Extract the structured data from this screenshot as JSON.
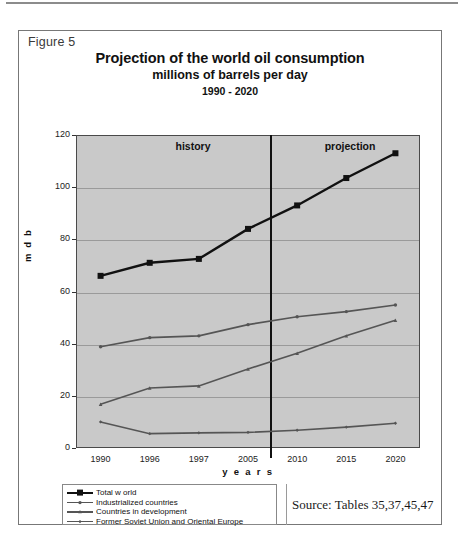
{
  "figure": {
    "label": "Figure 5",
    "title_main": "Projection of the world oil consumption",
    "title_sub": "millions of barrels per day",
    "title_range": "1990 - 2020",
    "source": "Source: Tables 35,37,45,47"
  },
  "annotations": {
    "history_label": "history",
    "projection_label": "projection"
  },
  "axis": {
    "ylabel": "m d b",
    "xlabel": "y e a r s",
    "yticks": [
      "0",
      "20",
      "40",
      "60",
      "80",
      "100",
      "120"
    ],
    "xticks": [
      "1990",
      "1996",
      "1997",
      "2005",
      "2010",
      "2015",
      "2020"
    ]
  },
  "colors": {
    "plot_background": "#c9c9c9",
    "gridline": "#9a9a9a",
    "axis": "#4a4a4a",
    "series_total_world": "#111111",
    "series_industrialized": "#555555",
    "series_development": "#555555",
    "series_fsu": "#555555",
    "divider": "#111111"
  },
  "chart_data": {
    "type": "line",
    "title": "Projection of the world oil consumption",
    "subtitle": "millions of barrels per day",
    "xlabel": "years",
    "ylabel": "m d b",
    "ylim": [
      0,
      120
    ],
    "ytick_step": 20,
    "grid": true,
    "legend_position": "below-left",
    "categories": [
      "1990",
      "1996",
      "1997",
      "2005",
      "2010",
      "2015",
      "2020"
    ],
    "annotations": [
      {
        "text": "history",
        "region": "left-of-divider"
      },
      {
        "text": "projection",
        "region": "right-of-divider"
      },
      {
        "text": "vertical divider between history and projection",
        "between": [
          "2005",
          "2010"
        ]
      }
    ],
    "series": [
      {
        "name": "Total world",
        "marker": "square",
        "values": [
          66,
          71,
          72.5,
          84,
          93,
          103.5,
          113
        ]
      },
      {
        "name": "Industrialized countries",
        "marker": "circle",
        "values": [
          38.8,
          42.3,
          43,
          47.3,
          50.3,
          52.3,
          54.8
        ]
      },
      {
        "name": "Countries in development",
        "marker": "triangle",
        "values": [
          16.8,
          23,
          23.8,
          30.3,
          36.3,
          43,
          49
        ]
      },
      {
        "name": "Former Soviet Union and Oriental Europe",
        "marker": "diamond",
        "values": [
          10,
          5.5,
          5.8,
          6,
          6.8,
          8,
          9.5
        ]
      }
    ]
  },
  "legend": {
    "items": [
      {
        "label": "Total w orld",
        "marker": "square"
      },
      {
        "label": "Industrialized countries",
        "marker": "circle"
      },
      {
        "label": "Countries in development",
        "marker": "triangle"
      },
      {
        "label": "Former Soviet Union and Oriental Europe",
        "marker": "diamond"
      }
    ]
  }
}
